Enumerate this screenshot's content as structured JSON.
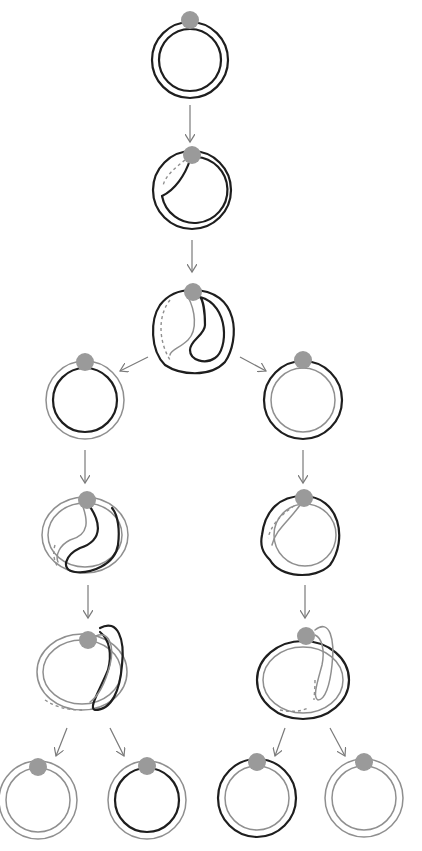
{
  "diagram": {
    "title": "",
    "colors": {
      "dark_strand": "#1e1e1e",
      "light_strand": "#8f8f8f",
      "anchor_dot": "#9a9a9a",
      "arrow": "#7a7a7a",
      "background": "#ffffff"
    },
    "nodes": [
      {
        "id": "n1",
        "level": 0,
        "shape": "double-ring",
        "outer": "dark",
        "inner": "dark"
      },
      {
        "id": "n2",
        "level": 1,
        "shape": "ring-with-inward-fold",
        "outer": "dark",
        "inner": "dark"
      },
      {
        "id": "n3",
        "level": 2,
        "shape": "ring-with-deep-S-fold",
        "outer": "dark",
        "inner": "mixed"
      },
      {
        "id": "n4",
        "level": 3,
        "branch": "left",
        "shape": "double-ring",
        "outer": "light",
        "inner": "dark"
      },
      {
        "id": "n5",
        "level": 3,
        "branch": "right",
        "shape": "double-ring",
        "outer": "dark",
        "inner": "light"
      },
      {
        "id": "n6",
        "level": 4,
        "branch": "left",
        "shape": "ring-with-S-fold",
        "outer": "light",
        "fold": "dark"
      },
      {
        "id": "n7",
        "level": 4,
        "branch": "right",
        "shape": "ring-with-inward-fold",
        "outer": "dark",
        "inner": "light"
      },
      {
        "id": "n8",
        "level": 5,
        "branch": "left",
        "shape": "ring-with-outer-loop",
        "outer": "light",
        "loop": "dark"
      },
      {
        "id": "n9",
        "level": 5,
        "branch": "right",
        "shape": "ring-with-outer-loop",
        "outer": "dark",
        "loop": "light"
      },
      {
        "id": "n10",
        "level": 6,
        "shape": "double-ring",
        "outer": "light",
        "inner": "light"
      },
      {
        "id": "n11",
        "level": 6,
        "shape": "double-ring",
        "outer": "light",
        "inner": "dark"
      },
      {
        "id": "n12",
        "level": 6,
        "shape": "double-ring",
        "outer": "dark",
        "inner": "light"
      },
      {
        "id": "n13",
        "level": 6,
        "shape": "double-ring",
        "outer": "light",
        "inner": "light"
      }
    ],
    "edges": [
      [
        "n1",
        "n2"
      ],
      [
        "n2",
        "n3"
      ],
      [
        "n3",
        "n4"
      ],
      [
        "n3",
        "n5"
      ],
      [
        "n4",
        "n6"
      ],
      [
        "n6",
        "n8"
      ],
      [
        "n8",
        "n10"
      ],
      [
        "n8",
        "n11"
      ],
      [
        "n5",
        "n7"
      ],
      [
        "n7",
        "n9"
      ],
      [
        "n9",
        "n12"
      ],
      [
        "n9",
        "n13"
      ]
    ]
  }
}
